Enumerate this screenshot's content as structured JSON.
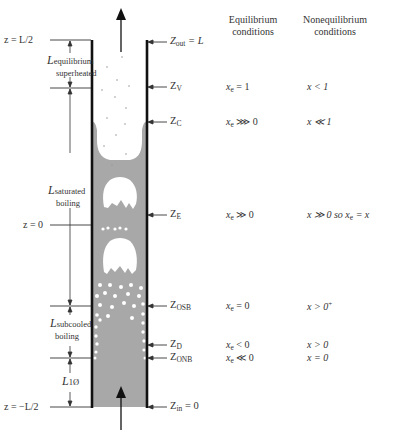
{
  "figure": {
    "colors": {
      "liquid": "#a8a8a8",
      "wall": "#111111",
      "vapor": "#ffffff",
      "text": "#333333"
    }
  },
  "columns": {
    "equilibrium_header_1": "Equilibrium",
    "equilibrium_header_2": "conditions",
    "nonequilibrium_header_1": "Nonequilibrium",
    "nonequilibrium_header_2": "conditions"
  },
  "left_axis": {
    "z_top": "z = L/2",
    "z_mid": "z = 0",
    "z_bottom": "z = −L/2"
  },
  "lengths": {
    "superheated": {
      "L": "L",
      "sub": "equilibrium",
      "line2": "superheated"
    },
    "saturated": {
      "L": "L",
      "sub": "saturated",
      "line2": "boiling"
    },
    "subcooled": {
      "L": "L",
      "sub": "subcooled",
      "line2": "boiling"
    },
    "single_phase": {
      "L": "L",
      "sub": "1Ø"
    }
  },
  "stations": [
    {
      "name": "Z",
      "sub": "out",
      "suffix": " = L",
      "eq": "",
      "noneq": ""
    },
    {
      "name": "Z",
      "sub": "V",
      "suffix": "",
      "eq_var": "x",
      "eq_sub": "e",
      "eq_rel": " = 1",
      "noneq": "x < 1"
    },
    {
      "name": "Z",
      "sub": "C",
      "suffix": "",
      "eq_var": "x",
      "eq_sub": "e",
      "eq_rel": " ⋙ 0",
      "noneq": "x ≪ 1"
    },
    {
      "name": "Z",
      "sub": "E",
      "suffix": "",
      "eq_var": "x",
      "eq_sub": "e",
      "eq_rel": " ≫ 0",
      "noneq": "x ≫ 0   so x",
      "noneq_sub": "e",
      "noneq_tail": " = x"
    },
    {
      "name": "Z",
      "sub": "OSB",
      "suffix": "",
      "eq_var": "x",
      "eq_sub": "e",
      "eq_rel": " = 0",
      "noneq": "x > 0",
      "noneq_sup": "+"
    },
    {
      "name": "Z",
      "sub": "D",
      "suffix": "",
      "eq_var": "x",
      "eq_sub": "e",
      "eq_rel": " < 0",
      "noneq": "x > 0"
    },
    {
      "name": "Z",
      "sub": "ONB",
      "suffix": "",
      "eq_var": "x",
      "eq_sub": "e",
      "eq_rel": " ≪ 0",
      "noneq": "x = 0"
    },
    {
      "name": "Z",
      "sub": "in",
      "suffix": " = 0",
      "eq": "",
      "noneq": ""
    }
  ],
  "arrows": {
    "inlet": "flow-in-arrow",
    "outlet": "flow-out-arrow"
  }
}
